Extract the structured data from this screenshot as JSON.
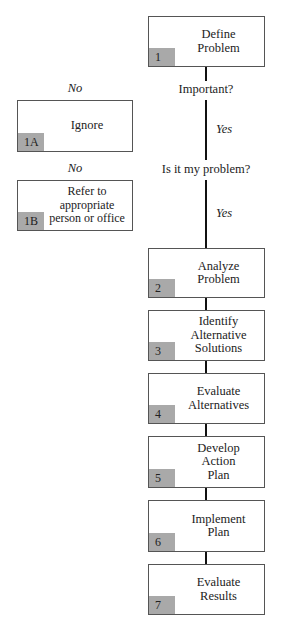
{
  "diagram": {
    "type": "flowchart",
    "steps": [
      {
        "id": "1",
        "label": "Define\nProblem"
      },
      {
        "id": "2",
        "label": "Analyze\nProblem"
      },
      {
        "id": "3",
        "label": "Identify\nAlternative\nSolutions"
      },
      {
        "id": "4",
        "label": "Evaluate\nAlternatives"
      },
      {
        "id": "5",
        "label": "Develop\nAction\nPlan"
      },
      {
        "id": "6",
        "label": "Implement\nPlan"
      },
      {
        "id": "7",
        "label": "Evaluate\nResults"
      }
    ],
    "side_steps": [
      {
        "id": "1A",
        "label": "Ignore"
      },
      {
        "id": "1B",
        "label": "Refer to\nappropriate\nperson or office"
      }
    ],
    "decisions": [
      {
        "question": "Important?",
        "no_label": "No",
        "yes_label": "Yes"
      },
      {
        "question": "Is it my problem?",
        "no_label": "No",
        "yes_label": "Yes"
      }
    ]
  }
}
